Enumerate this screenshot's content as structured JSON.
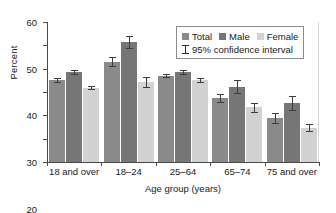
{
  "chart_data": {
    "type": "bar",
    "title": "",
    "xlabel": "Age group (years)",
    "ylabel": "Percent",
    "ylim": [
      0,
      60
    ],
    "yticks": [
      0,
      10,
      20,
      30,
      40,
      50,
      60
    ],
    "grid": false,
    "legend_position": "top-right",
    "categories": [
      "18 and over",
      "18–24",
      "25–64",
      "65–74",
      "75 and over"
    ],
    "series": [
      {
        "name": "Total",
        "color": "#8a8a8a",
        "values": [
          35.0,
          43.0,
          37.0,
          27.4,
          18.8
        ],
        "ci_low": [
          34.3,
          41.2,
          36.3,
          25.9,
          16.9
        ],
        "ci_high": [
          35.8,
          44.9,
          37.8,
          29.1,
          20.8
        ]
      },
      {
        "name": "Male",
        "color": "#767676",
        "values": [
          38.6,
          51.5,
          38.6,
          32.2,
          25.2
        ],
        "ci_low": [
          37.8,
          48.8,
          37.8,
          29.6,
          22.3
        ],
        "ci_high": [
          39.4,
          54.2,
          39.4,
          35.0,
          28.3
        ]
      },
      {
        "name": "Female",
        "color": "#d2d2d2",
        "values": [
          31.8,
          34.3,
          35.2,
          23.4,
          14.6
        ],
        "ci_low": [
          31.2,
          32.1,
          34.4,
          21.6,
          13.1
        ],
        "ci_high": [
          32.4,
          36.6,
          36.0,
          25.3,
          16.3
        ]
      }
    ],
    "annotations": [
      "95% confidence interval"
    ]
  },
  "legend": {
    "items": [
      {
        "label": "Total"
      },
      {
        "label": "Male"
      },
      {
        "label": "Female"
      }
    ],
    "ci_label": "95% confidence interval"
  }
}
